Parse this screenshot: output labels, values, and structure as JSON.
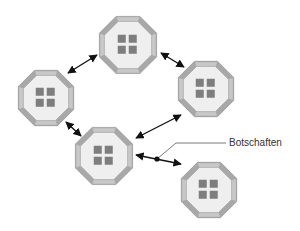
{
  "diagram": {
    "label": "Botschaften",
    "colors": {
      "octagon_border": "#a8a8a8",
      "octagon_border_light": "#c8c8c8",
      "octagon_fill": "#efefef",
      "square_fill": "#7e7e7e",
      "arrow": "#111111",
      "leader_line": "#555555"
    },
    "nodes": [
      {
        "id": "top",
        "cx": 128,
        "cy": 45,
        "r": 31
      },
      {
        "id": "left",
        "cx": 46,
        "cy": 98,
        "r": 30
      },
      {
        "id": "right",
        "cx": 206,
        "cy": 89,
        "r": 30
      },
      {
        "id": "middle",
        "cx": 104,
        "cy": 156,
        "r": 31
      },
      {
        "id": "bottom-right",
        "cx": 209,
        "cy": 190,
        "r": 30
      }
    ],
    "edges": [
      {
        "from": "top",
        "to": "left",
        "x1": 97,
        "y1": 55,
        "x2": 68,
        "y2": 73
      },
      {
        "from": "top",
        "to": "right",
        "x1": 161,
        "y1": 53,
        "x2": 184,
        "y2": 67
      },
      {
        "from": "left",
        "to": "middle",
        "x1": 66,
        "y1": 122,
        "x2": 81,
        "y2": 136
      },
      {
        "from": "middle",
        "to": "right",
        "x1": 136,
        "y1": 138,
        "x2": 181,
        "y2": 115
      },
      {
        "from": "middle",
        "to": "bottom-right",
        "x1": 136,
        "y1": 155,
        "x2": 181,
        "y2": 164
      }
    ],
    "message_marker": {
      "x": 157,
      "y": 159
    },
    "leader": {
      "points": "157,159 176,143 226,143"
    },
    "label_pos": {
      "x": 229,
      "y": 146
    }
  }
}
